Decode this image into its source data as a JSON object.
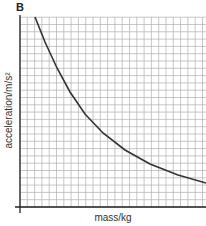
{
  "figure": {
    "label": "B"
  },
  "chart_data": {
    "type": "line",
    "title": "",
    "xlabel": "mass/kg",
    "ylabel": "acceleration/m/s²",
    "grid": true,
    "legend": null,
    "x": [
      0.1,
      0.2,
      0.3,
      0.4,
      0.5,
      0.6,
      0.7,
      0.8,
      0.9,
      1.0
    ],
    "values": [
      1.0,
      0.78,
      0.62,
      0.5,
      0.41,
      0.34,
      0.28,
      0.23,
      0.19,
      0.13
    ],
    "note": "Unlabeled axes; curve shows acceleration decreasing inversely with mass (normalized units)"
  },
  "colors": {
    "grid": "#b0b0b0",
    "axis": "#222222",
    "curve": "#333333"
  }
}
